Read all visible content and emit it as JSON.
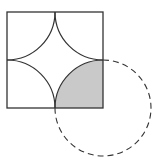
{
  "diagram": {
    "square": {
      "x": 7,
      "y": 12,
      "size": 96
    },
    "arc_radius": 48,
    "dashed_circle": {
      "cx": 103,
      "cy": 108,
      "r": 47
    },
    "colors": {
      "stroke": "#333333",
      "shade": "#c9c9c9",
      "background": "#ffffff"
    }
  }
}
